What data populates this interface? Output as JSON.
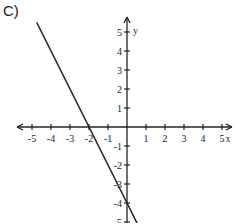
{
  "problem_label": "C)",
  "chart_data": {
    "type": "line",
    "title": "",
    "xlabel": "x",
    "ylabel": "y",
    "xlim": [
      -5,
      5
    ],
    "ylim": [
      -5,
      5
    ],
    "x_ticks": [
      -5,
      -4,
      -3,
      -2,
      -1,
      1,
      2,
      3,
      4,
      5
    ],
    "y_ticks": [
      -5,
      -4,
      -3,
      -2,
      -1,
      1,
      2,
      3,
      4,
      5
    ],
    "grid": false,
    "series": [
      {
        "name": "y = -2x - 4",
        "x": [
          -4.75,
          0.6
        ],
        "y": [
          5.5,
          -5.2
        ],
        "slope": -2,
        "intercept": -4
      }
    ]
  }
}
